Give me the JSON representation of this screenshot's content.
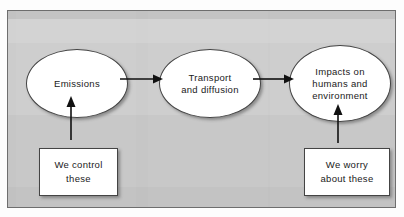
{
  "diagram": {
    "background_color": "#c8c8c8",
    "node_fill": "#ffffff",
    "node_stroke": "#444444",
    "nodes": [
      {
        "id": "emissions",
        "shape": "ellipse",
        "lines": [
          "Emissions"
        ],
        "line1": "Emissions"
      },
      {
        "id": "transport",
        "shape": "ellipse",
        "lines": [
          "Transport",
          "and diffusion"
        ],
        "line1": "Transport",
        "line2": "and diffusion"
      },
      {
        "id": "impacts",
        "shape": "ellipse",
        "lines": [
          "Impacts on",
          "humans and",
          "environment"
        ],
        "line1": "Impacts on",
        "line2": "humans and",
        "line3": "environment"
      },
      {
        "id": "we-control",
        "shape": "rectangle",
        "lines": [
          "We control",
          "these"
        ],
        "line1": "We control",
        "line2": "these"
      },
      {
        "id": "we-worry",
        "shape": "rectangle",
        "lines": [
          "We worry",
          "about these"
        ],
        "line1": "We worry",
        "line2": "about these"
      }
    ],
    "edges": [
      {
        "id": "emissions-to-transport",
        "from": "emissions",
        "to": "transport",
        "direction": "right",
        "style": "solid-arrow"
      },
      {
        "id": "transport-to-impacts",
        "from": "transport",
        "to": "impacts",
        "direction": "right",
        "style": "solid-arrow"
      },
      {
        "id": "we-control-to-emissions",
        "from": "we-control",
        "to": "emissions",
        "direction": "up",
        "style": "solid-arrow"
      },
      {
        "id": "we-worry-to-impacts",
        "from": "we-worry",
        "to": "impacts",
        "direction": "up",
        "style": "solid-arrow"
      }
    ]
  }
}
